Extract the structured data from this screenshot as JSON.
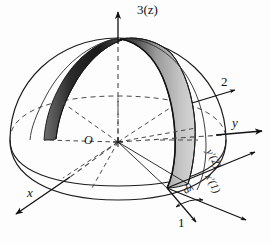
{
  "figure": {
    "background_color": "#fdfdfd",
    "line_color": "#111111",
    "dash_color": "#4a4a4a",
    "lune_dark_color": "#2b2b2b",
    "lune_light_color": "#c9c9c9"
  },
  "labels": {
    "axis_3_z": "3(z)",
    "axis_2": "2",
    "axis_y": "y",
    "axis_x": "x",
    "axis_1": "1",
    "origin": "O",
    "axis_y_prime": "y'(2)",
    "axis_x_prime": "x'(1)",
    "angle_increment": "dλ"
  },
  "geometry": {
    "sphere_center": [
      118,
      142
    ],
    "sphere_radius_x": 108,
    "sphere_radius_y": 102,
    "equator_tilt_ry": 42,
    "pole_top": [
      118,
      38
    ],
    "lune_count": 2
  }
}
